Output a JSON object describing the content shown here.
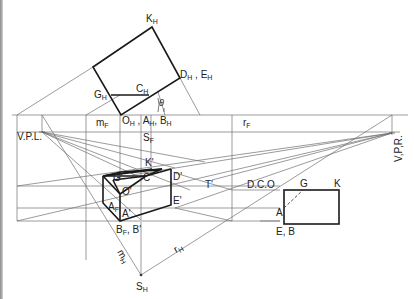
{
  "figure": {
    "plan_labels": {
      "K_H": "K",
      "D_H_E_H": "D",
      "C_H": "C",
      "G_H": "G",
      "theta": "θ",
      "O_H_A_H_B_H": "O",
      "m_F": "m",
      "r_F": "r",
      "S_F": "S"
    },
    "subscripts": {
      "H": "H",
      "F": "F"
    },
    "side_labels": {
      "vpl": "V.P.L.",
      "vpr": "V,P,R."
    },
    "perspective_labels": {
      "K_prime": "K'",
      "G_prime": "G'",
      "C_prime": "C'",
      "D_prime": "D'",
      "O_prime": "O'",
      "T_prime": "T'",
      "E_prime": "E'",
      "A_F": "A",
      "A_prime": "A'",
      "B_F_B_prime": "B",
      "B_F_B_prime_suffix": ", B'",
      "dco": "D.C.O",
      "m_H": "m",
      "r_H": "r",
      "S_H": "S"
    },
    "elevation_labels": {
      "G": "G",
      "K": "K",
      "A": "A",
      "E_B": "E,  B"
    },
    "plan_composite": {
      "D_H_suffix": " ,  E",
      "O_H_suffix": " ,  A",
      "A_H_suffix": ",  B"
    },
    "colors": {
      "ink": "#1a1a1a",
      "construction": "#707070",
      "background": "#ffffff"
    }
  }
}
